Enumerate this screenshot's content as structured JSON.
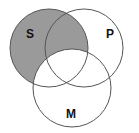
{
  "diagram": {
    "type": "venn",
    "sets": [
      {
        "label": "S",
        "cx": 49,
        "cy": 48,
        "r": 39
      },
      {
        "label": "P",
        "cx": 84,
        "cy": 48,
        "r": 39
      },
      {
        "label": "M",
        "cx": 72,
        "cy": 88,
        "r": 39
      }
    ],
    "shaded_region": "S minus M",
    "colors": {
      "shade": "#9a9a9a",
      "stroke": "#555555",
      "background": "#ffffff",
      "label": "#111111"
    }
  }
}
